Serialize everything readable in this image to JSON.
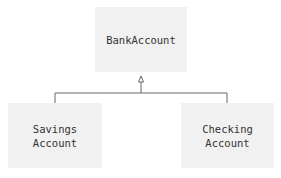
{
  "diagram": {
    "type": "class-inheritance",
    "parent": {
      "label": "BankAccount"
    },
    "children": [
      {
        "label_line1": "Savings",
        "label_line2": "Account"
      },
      {
        "label_line1": "Checking",
        "label_line2": "Account"
      }
    ],
    "colors": {
      "box_fill": "#f1f1f1",
      "line": "#666666",
      "text": "#333333"
    }
  }
}
